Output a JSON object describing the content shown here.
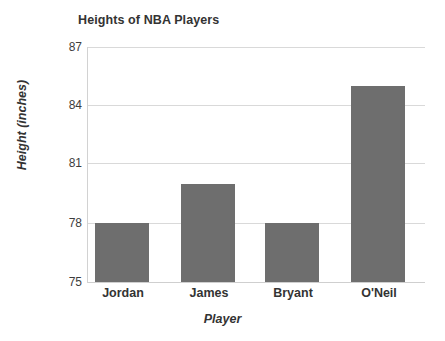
{
  "chart_data": {
    "type": "bar",
    "title": "Heights of NBA Players",
    "xlabel": "Player",
    "ylabel": "Height (inches)",
    "categories": [
      "Jordan",
      "James",
      "Bryant",
      "O'Neil"
    ],
    "values": [
      78,
      80,
      78,
      85
    ],
    "ytick_labels": [
      "87",
      "84",
      "81",
      "78",
      "75"
    ],
    "yticks": [
      87,
      84,
      81,
      78,
      75
    ],
    "ylim": [
      75,
      87
    ],
    "grid": "horizontal",
    "legend": "none",
    "bar_color": "#6e6e6e",
    "gridline_color": "#d9d9d9",
    "text_color": "#333333",
    "background_color": "#ffffff"
  }
}
